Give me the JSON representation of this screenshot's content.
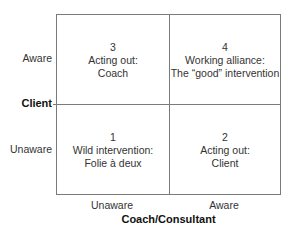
{
  "diagram": {
    "y_axis": {
      "title": "Client",
      "labels": {
        "top": "Aware",
        "bottom": "Unaware"
      }
    },
    "x_axis": {
      "title": "Coach/Consultant",
      "labels": {
        "left": "Unaware",
        "right": "Aware"
      }
    },
    "quadrants": {
      "top_left": {
        "number": "3",
        "line1": "Acting out:",
        "line2": "Coach"
      },
      "top_right": {
        "number": "4",
        "line1": "Working alliance:",
        "line2": "The “good” intervention"
      },
      "bottom_left": {
        "number": "1",
        "line1": "Wild intervention:",
        "line2": "Folie à deux"
      },
      "bottom_right": {
        "number": "2",
        "line1": "Acting out:",
        "line2": "Client"
      }
    },
    "colors": {
      "line": "#7a7a7a",
      "text": "#333333"
    }
  }
}
